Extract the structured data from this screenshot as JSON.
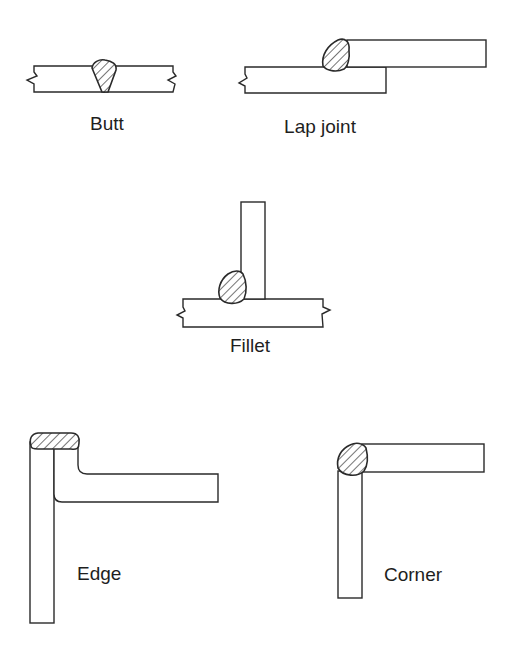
{
  "diagram": {
    "type": "welded-joint-types",
    "joints": [
      {
        "id": "butt",
        "label": "Butt"
      },
      {
        "id": "lap",
        "label": "Lap joint"
      },
      {
        "id": "fillet",
        "label": "Fillet"
      },
      {
        "id": "edge",
        "label": "Edge"
      },
      {
        "id": "corner",
        "label": "Corner"
      }
    ],
    "colors": {
      "line": "#2a2a2a",
      "text": "#1e1e1e",
      "background": "#ffffff"
    }
  }
}
